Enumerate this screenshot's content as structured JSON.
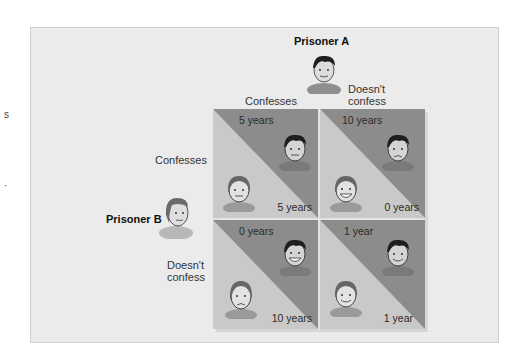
{
  "diagram": {
    "prisoner_a": {
      "label": "Prisoner A",
      "choices": [
        "Confesses",
        "Doesn't confess"
      ]
    },
    "prisoner_b": {
      "label": "Prisoner B",
      "choices": [
        "Confesses",
        "Doesn't confess"
      ]
    },
    "labels": {
      "a_confesses": "Confesses",
      "a_doesnt_line1": "Doesn't",
      "a_doesnt_line2": "confess",
      "b_confesses": "Confesses",
      "b_doesnt_line1": "Doesn't",
      "b_doesnt_line2": "confess"
    },
    "cells": [
      {
        "row": "B confesses",
        "col": "A confesses",
        "a_sentence": "5 years",
        "b_sentence": "5 years",
        "a_face": "neutral",
        "b_face": "neutral"
      },
      {
        "row": "B confesses",
        "col": "A doesn't confess",
        "a_sentence": "10 years",
        "b_sentence": "0 years",
        "a_face": "sad",
        "b_face": "happy"
      },
      {
        "row": "B doesn't confess",
        "col": "A confesses",
        "a_sentence": "0 years",
        "b_sentence": "10 years",
        "a_face": "happy",
        "b_face": "sad"
      },
      {
        "row": "B doesn't confess",
        "col": "A doesn't confess",
        "a_sentence": "1 year",
        "b_sentence": "1 year",
        "a_face": "smile",
        "b_face": "smile"
      }
    ],
    "colors": {
      "frame_bg": "#ebebeb",
      "prisoner_a_triangle": "#8c8c8c",
      "prisoner_b_triangle": "#c9c9c9",
      "grid_divider": "#e4e4e4"
    }
  },
  "margin_fragments": [
    "s",
    "·"
  ]
}
